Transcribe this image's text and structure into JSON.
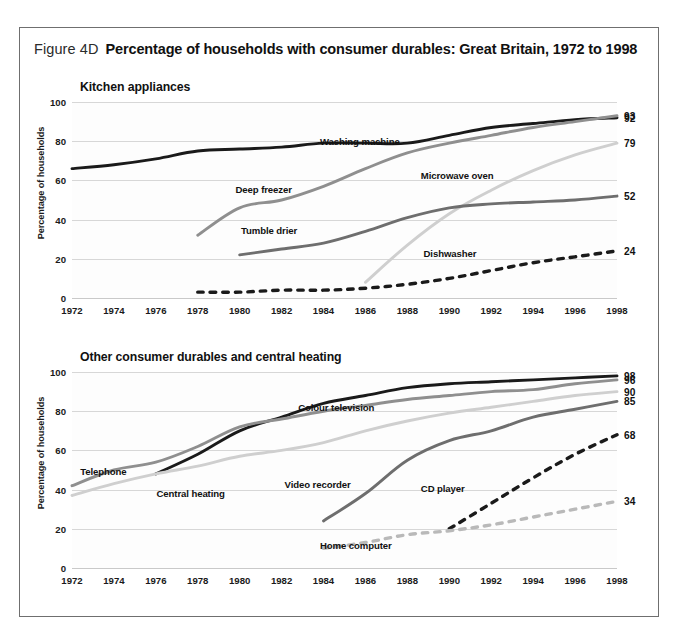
{
  "figure": {
    "number": "Figure 4D",
    "title": "Percentage of households with consumer durables:  Great Britain, 1972 to 1998"
  },
  "axis": {
    "y_label": "Percentage of households",
    "y_ticks": [
      "0",
      "20",
      "40",
      "60",
      "80",
      "100"
    ],
    "x_ticks": [
      "1972",
      "1974",
      "1976",
      "1978",
      "1980",
      "1982",
      "1984",
      "1986",
      "1988",
      "1990",
      "1992",
      "1994",
      "1996",
      "1998"
    ]
  },
  "panels": [
    {
      "id": "kitchen",
      "title": "Kitchen appliances",
      "end_labels": [
        "93",
        "92",
        "79",
        "52",
        "24"
      ],
      "series_labels": [
        "Washing machine",
        "Deep freezer",
        "Microwave oven",
        "Tumble drier",
        "Dishwasher"
      ]
    },
    {
      "id": "other",
      "title": "Other consumer durables and central heating",
      "end_labels": [
        "98",
        "96",
        "90",
        "85",
        "68",
        "34"
      ],
      "series_labels": [
        "Colour television",
        "Telephone",
        "Central heating",
        "Video recorder",
        "CD player",
        "Home computer"
      ]
    }
  ],
  "colors": {
    "dark": "#1a1a1a",
    "mid_dark": "#6e6e6e",
    "mid": "#8f8f8f",
    "light": "#b9b9b9",
    "lighter": "#cfcfcf",
    "grid": "#d7d7d7",
    "frame": "#6f6f6f"
  },
  "chart_data": {
    "type": "line",
    "title": "Percentage of households with consumer durables: Great Britain, 1972 to 1998",
    "xlabel": "",
    "ylabel": "Percentage of households",
    "ylim": [
      0,
      100
    ],
    "xlim": [
      1972,
      1998
    ],
    "grid": true,
    "legend": "inline-series-labels",
    "panels": [
      {
        "subtitle": "Kitchen appliances",
        "x": [
          1972,
          1974,
          1976,
          1978,
          1980,
          1982,
          1984,
          1986,
          1988,
          1990,
          1992,
          1994,
          1996,
          1998
        ],
        "series": [
          {
            "name": "Washing machine",
            "style": "solid",
            "color": "#1a1a1a",
            "end_value": 92,
            "values": [
              66,
              68,
              71,
              75,
              76,
              77,
              79,
              79,
              79,
              83,
              87,
              89,
              91,
              92
            ]
          },
          {
            "name": "Deep freezer",
            "style": "solid",
            "color": "#8f8f8f",
            "end_value": 93,
            "values": [
              null,
              null,
              null,
              32,
              46,
              50,
              57,
              66,
              74,
              79,
              83,
              87,
              90,
              93
            ]
          },
          {
            "name": "Microwave oven",
            "style": "solid",
            "color": "#cfcfcf",
            "end_value": 79,
            "values": [
              null,
              null,
              null,
              null,
              null,
              null,
              null,
              8,
              27,
              43,
              55,
              65,
              73,
              79
            ]
          },
          {
            "name": "Tumble drier",
            "style": "solid",
            "color": "#6e6e6e",
            "end_value": 52,
            "values": [
              null,
              null,
              null,
              null,
              22,
              25,
              28,
              34,
              41,
              46,
              48,
              49,
              50,
              52
            ]
          },
          {
            "name": "Dishwasher",
            "style": "dashed",
            "color": "#1a1a1a",
            "end_value": 24,
            "values": [
              null,
              null,
              null,
              3,
              3,
              4,
              4,
              5,
              7,
              10,
              14,
              18,
              21,
              24
            ]
          }
        ]
      },
      {
        "subtitle": "Other consumer durables and central heating",
        "x": [
          1972,
          1974,
          1976,
          1978,
          1980,
          1982,
          1984,
          1986,
          1988,
          1990,
          1992,
          1994,
          1996,
          1998
        ],
        "series": [
          {
            "name": "Colour television",
            "style": "solid",
            "color": "#1a1a1a",
            "end_value": 98,
            "values": [
              null,
              null,
              48,
              58,
              70,
              77,
              84,
              88,
              92,
              94,
              95,
              96,
              97,
              98
            ]
          },
          {
            "name": "Telephone",
            "style": "solid",
            "color": "#8f8f8f",
            "end_value": 96,
            "values": [
              42,
              50,
              54,
              62,
              72,
              76,
              80,
              83,
              86,
              88,
              90,
              91,
              94,
              96
            ]
          },
          {
            "name": "Central heating",
            "style": "solid",
            "color": "#cfcfcf",
            "end_value": 90,
            "values": [
              37,
              43,
              48,
              52,
              57,
              60,
              64,
              70,
              75,
              79,
              82,
              85,
              88,
              90
            ]
          },
          {
            "name": "Video recorder",
            "style": "solid",
            "color": "#6e6e6e",
            "end_value": 85,
            "values": [
              null,
              null,
              null,
              null,
              null,
              null,
              24,
              38,
              55,
              65,
              70,
              77,
              81,
              85
            ]
          },
          {
            "name": "CD player",
            "style": "dashed",
            "color": "#1a1a1a",
            "end_value": 68,
            "values": [
              null,
              null,
              null,
              null,
              null,
              null,
              null,
              null,
              null,
              20,
              33,
              46,
              58,
              68
            ]
          },
          {
            "name": "Home computer",
            "style": "dashed",
            "color": "#b9b9b9",
            "end_value": 34,
            "values": [
              null,
              null,
              null,
              null,
              null,
              null,
              10,
              13,
              17,
              19,
              22,
              26,
              30,
              34
            ]
          }
        ]
      }
    ]
  }
}
